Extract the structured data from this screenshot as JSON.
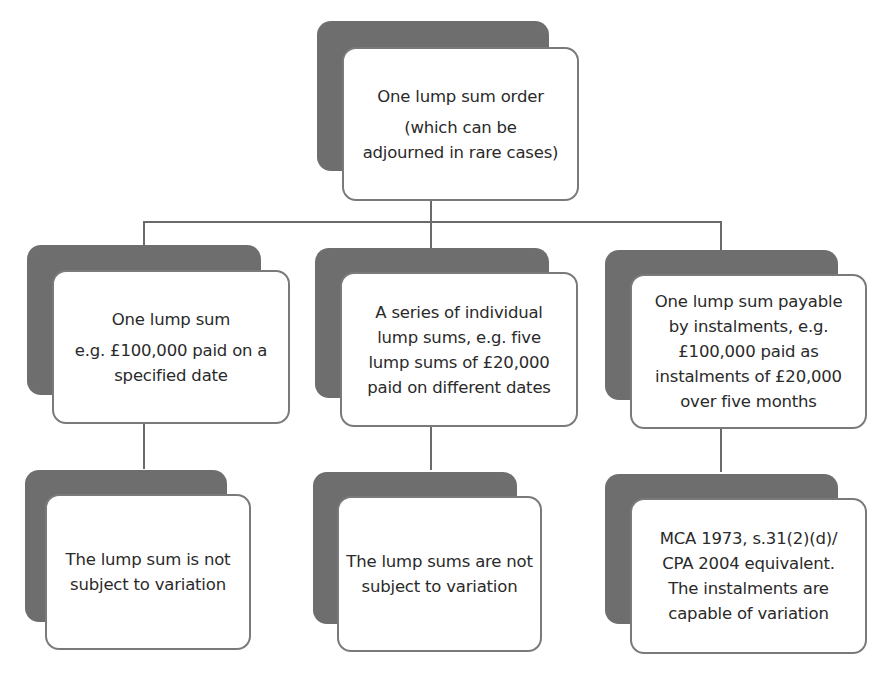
{
  "diagram": {
    "title_node": {
      "lines": [
        "One lump sum order",
        "(which can be",
        "adjourned in rare cases)"
      ]
    },
    "branches": [
      {
        "type_node": {
          "lines": [
            "One lump sum",
            "e.g. £100,000 paid on a",
            "specified date"
          ]
        },
        "outcome_node": {
          "lines": [
            "The lump sum is not",
            "subject to variation"
          ]
        }
      },
      {
        "type_node": {
          "lines": [
            "A series of individual",
            "lump sums, e.g. five",
            "lump sums of £20,000",
            "paid on different dates"
          ]
        },
        "outcome_node": {
          "lines": [
            "The lump sums are not",
            "subject to variation"
          ]
        }
      },
      {
        "type_node": {
          "lines": [
            "One lump sum payable",
            "by instalments, e.g.",
            "£100,000 paid as",
            "instalments of £20,000",
            "over five months"
          ]
        },
        "outcome_node": {
          "lines": [
            "MCA 1973, s.31(2)(d)/",
            "CPA 2004 equivalent.",
            "The instalments are",
            "capable of variation"
          ]
        }
      }
    ],
    "colors": {
      "shadow": "#6e6e6e",
      "card_border": "#7a7a7a",
      "connector": "#6a6a6a",
      "text": "#2a2a2a"
    }
  }
}
